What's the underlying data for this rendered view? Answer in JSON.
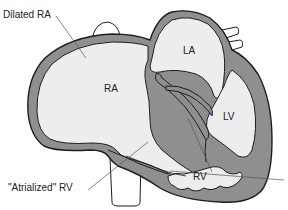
{
  "diagram": {
    "colors": {
      "wall": "#8f8f8f",
      "wall_outline": "#1e1e1e",
      "chamber": "#ededed",
      "background": "#ffffff",
      "leader_line": "#555555"
    },
    "labels": {
      "dilated_ra": "Dilated RA",
      "ra": "RA",
      "la": "LA",
      "lv": "LV",
      "rv": "RV",
      "atrialized_rv": "\"Atrialized\" RV"
    }
  }
}
